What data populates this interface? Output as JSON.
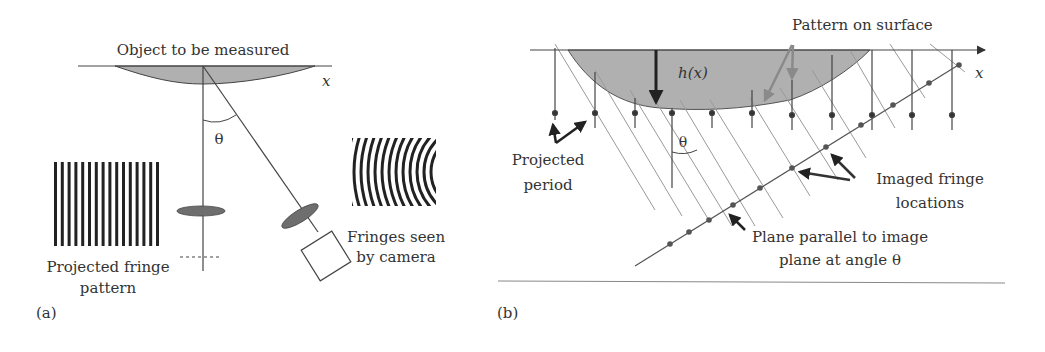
{
  "panel_a": {
    "label": "(a)",
    "object_label": "Object to be measured",
    "axis_label": "x",
    "angle_label": "θ",
    "projected_label_line1": "Projected fringe",
    "projected_label_line2": "pattern",
    "camera_label_line1": "Fringes seen",
    "camera_label_line2": "by camera"
  },
  "panel_b": {
    "label": "(b)",
    "pattern_label": "Pattern on surface",
    "axis_label": "x",
    "height_label": "h(x)",
    "angle_label": "θ",
    "period_label_line1": "Projected",
    "period_label_line2": "period",
    "imaged_label_line1": "Imaged fringe",
    "imaged_label_line2": "locations",
    "plane_label_line1": "Plane parallel to image",
    "plane_label_line2": "plane at angle θ"
  },
  "colors": {
    "ink": "#333333",
    "object_fill": "#b0b0b0",
    "lens_fill": "#6e6e6e",
    "light_line": "#9a9a9a",
    "grey_arrow": "#8a8a8a"
  }
}
